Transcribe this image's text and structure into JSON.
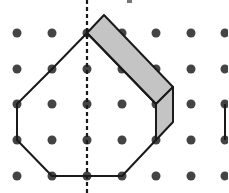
{
  "figure": {
    "colors": {
      "background": "#ffffff",
      "dot": "#444444",
      "outline": "#1a1a1a",
      "shade": "#c4c4c4",
      "dashed_line": "#1a1a1a"
    },
    "grid": {
      "columns_x": [
        17,
        52,
        87,
        122,
        156,
        191,
        225
      ],
      "rows_y": [
        33,
        69,
        104,
        140,
        176
      ],
      "dot_radius": 4.5
    },
    "polygon_outline": [
      [
        87,
        33
      ],
      [
        52,
        69
      ],
      [
        17,
        104
      ],
      [
        17,
        140
      ],
      [
        52,
        176
      ],
      [
        122,
        176
      ],
      [
        156,
        140
      ],
      [
        156,
        104
      ],
      [
        87,
        33
      ]
    ],
    "shaded_region": {
      "top_face": [
        [
          87,
          33
        ],
        [
          104,
          15
        ],
        [
          173,
          87
        ],
        [
          156,
          104
        ]
      ],
      "side_face": [
        [
          156,
          104
        ],
        [
          173,
          87
        ],
        [
          173,
          122
        ],
        [
          156,
          140
        ]
      ]
    },
    "symmetry_line": {
      "x": 87,
      "y1": 0,
      "y2": 193
    },
    "partial_edge_right": {
      "x": 225,
      "y1": 104,
      "y2": 140
    },
    "small_marker": {
      "x": 127,
      "y": 0,
      "w": 5,
      "h": 3
    }
  }
}
